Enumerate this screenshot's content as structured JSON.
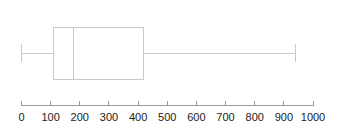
{
  "chart_data": {
    "type": "box",
    "title": "",
    "xlabel": "",
    "ylabel": "",
    "orientation": "horizontal",
    "xlim": [
      0,
      1000
    ],
    "grid": false,
    "legend": null,
    "tick_labels": [
      "0",
      "100",
      "200",
      "300",
      "400",
      "500",
      "600",
      "700",
      "800",
      "900",
      "1000"
    ],
    "tick_values": [
      0,
      100,
      200,
      300,
      400,
      500,
      600,
      700,
      800,
      900,
      1000
    ],
    "tick_step": 100,
    "boxes": [
      {
        "name": "series-1",
        "min": 0,
        "q1": 110,
        "median": 180,
        "q3": 420,
        "max": 940,
        "outliers": []
      }
    ],
    "colors": {
      "line": "#c9c9c9",
      "box_fill": "#ffffff",
      "axis": "#9a9a9a",
      "tick_text": "#1a1a1a",
      "background": "#ffffff"
    }
  }
}
